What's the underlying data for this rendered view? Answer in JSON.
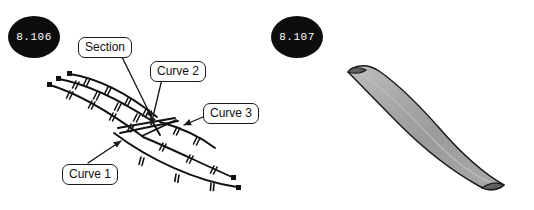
{
  "page": {
    "width": 534,
    "height": 210,
    "background": "#ffffff"
  },
  "figures": [
    {
      "id": "fig-8-106",
      "badge": "8.106",
      "caption_kind": "wireframe-curve-network",
      "description": "Wireframe of three section curves with tick marks and square endpoints"
    },
    {
      "id": "fig-8-107",
      "badge": "8.107",
      "caption_kind": "shaded-lofted-surface",
      "description": "Shaded grey lofted blade surface resulting from the curve network"
    }
  ],
  "badges": {
    "left": "8.106",
    "right": "8.107",
    "fill": "#0d0d0d",
    "text_color": "#ffffff"
  },
  "callouts": [
    {
      "key": "section",
      "label": "Section"
    },
    {
      "key": "curve2",
      "label": "Curve 2"
    },
    {
      "key": "curve3",
      "label": "Curve 3"
    },
    {
      "key": "curve1",
      "label": "Curve 1"
    }
  ],
  "colors": {
    "ink": "#1a1a1a",
    "curve": "#111111",
    "surface_fill": "#a3a3a3",
    "surface_fill_light": "#b8b8b8",
    "surface_edge": "#1a1a1a",
    "cap_fill": "#6e6e6e",
    "background": "#ffffff"
  },
  "geometry": {
    "curves": [
      {
        "name": "curve-a-top",
        "path": "M 57 80 C 90 86, 125 104, 150 120",
        "start_marker": "square",
        "end_marker": "none",
        "ticks": 5
      },
      {
        "name": "curve-b-mid",
        "path": "M 68 75 C 100 80, 130 97, 155 116",
        "start_marker": "square",
        "end_marker": "none",
        "ticks": 5
      },
      {
        "name": "curve-c-low",
        "path": "M 49 86 C 85 96, 118 119, 140 135",
        "start_marker": "square",
        "end_marker": "none",
        "ticks": 4
      },
      {
        "name": "curve-1-lower-arc",
        "path": "M 115 131 C 150 152, 190 172, 236 183",
        "start_marker": "none",
        "end_marker": "square",
        "ticks": 4
      },
      {
        "name": "curve-2-upper-sweep",
        "path": "M 118 129 C 150 128, 185 133, 208 143",
        "start_marker": "none",
        "end_marker": "none",
        "ticks": 3
      },
      {
        "name": "curve-3-tail",
        "path": "M 150 120 C 175 131, 205 152, 232 176",
        "start_marker": "none",
        "end_marker": "square",
        "ticks": 4
      }
    ],
    "leader_lines": [
      {
        "from_callout": "section",
        "to_point": [
          150,
          121
        ],
        "arrow": true
      },
      {
        "from_callout": "curve2",
        "to_point": [
          150,
          127
        ],
        "arrow": true
      },
      {
        "from_callout": "curve3",
        "to_point": [
          186,
          126
        ],
        "arrow": true
      },
      {
        "from_callout": "curve1",
        "to_point": [
          122,
          142
        ],
        "arrow": true
      }
    ],
    "surface": {
      "outline": "M 352 68 C 362 64, 372 66, 381 72 C 404 88, 430 112, 455 140 C 478 166, 495 180, 506 186 C 498 192, 488 191, 479 186 C 452 171, 418 148, 392 126 C 366 104, 352 86, 346 74 Z",
      "fill": "#a3a3a3",
      "stroke": "#1a1a1a"
    }
  }
}
